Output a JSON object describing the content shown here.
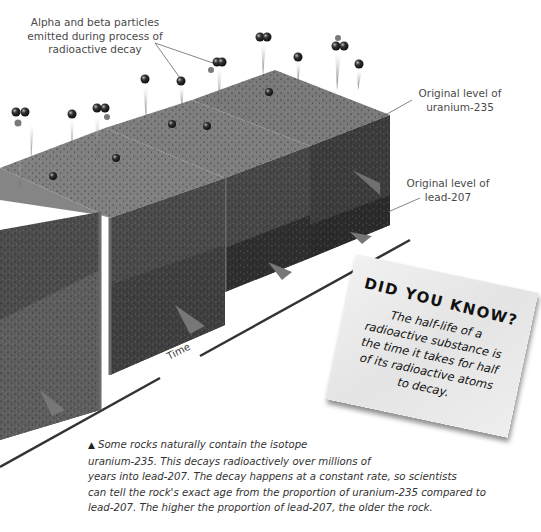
{
  "labels": {
    "particles": [
      "Alpha and beta particles",
      "emitted during process of",
      "radioactive decay"
    ],
    "uranium": [
      "Original level of",
      "uranium-235"
    ],
    "lead": [
      "Original level of",
      "lead-207"
    ],
    "time_axis": "Time"
  },
  "did_you_know": {
    "title": "DID YOU KNOW?",
    "body_lines": [
      "The half-life of a",
      "radioactive substance is",
      "the time it takes for half",
      "of its radioactive atoms",
      "to decay."
    ]
  },
  "caption": {
    "marker": "▲",
    "lines": [
      "Some rocks naturally contain the isotope",
      "uranium-235. This decays radioactively over millions of",
      "years into lead-207. The decay happens at a constant rate, so scientists",
      "can tell the rock's exact age from the proportion of uranium-235 compared to",
      "lead-207. The higher the proportion of lead-207, the older the rock."
    ]
  },
  "colors": {
    "rock_top": "#7d7d7d",
    "rock_front": "#4e4e4e",
    "rock_side": "#3e3e3e",
    "lead_layer_front": "#5c5c5c",
    "lead_layer_dark": "#303030",
    "card_bg": "#ececec",
    "text": "#333333"
  }
}
